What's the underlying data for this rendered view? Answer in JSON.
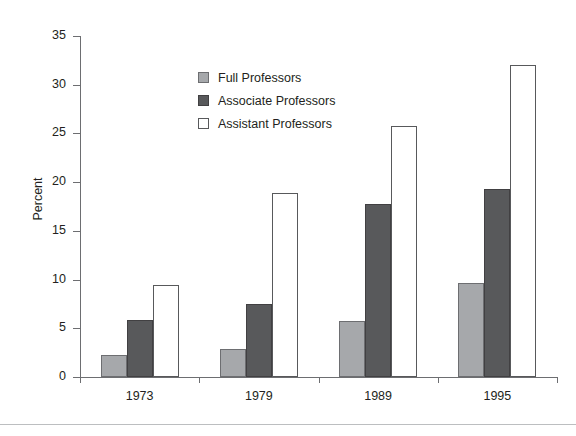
{
  "chart_data": {
    "type": "bar",
    "title": "",
    "xlabel": "",
    "ylabel": "Percent",
    "categories": [
      "1973",
      "1979",
      "1989",
      "1995"
    ],
    "ylim": [
      0,
      35
    ],
    "ytick_labels": [
      "0",
      "5",
      "10",
      "15",
      "20",
      "25",
      "30",
      "35"
    ],
    "ytick_values": [
      0,
      5,
      10,
      15,
      20,
      25,
      30,
      35
    ],
    "grid": false,
    "legend_position": "upper-left-inside",
    "series": [
      {
        "name": "Full Professors",
        "color": "#a6a8ab",
        "edge_color": "#6d6e71",
        "values": [
          2.3,
          2.9,
          5.8,
          9.6
        ]
      },
      {
        "name": "Associate Professors",
        "color": "#58595b",
        "edge_color": "#414042",
        "values": [
          5.9,
          7.5,
          17.8,
          19.3
        ]
      },
      {
        "name": "Assistant Professors",
        "color": "#ffffff",
        "edge_color": "#58595b",
        "values": [
          9.4,
          18.9,
          25.8,
          32.0
        ]
      }
    ]
  },
  "axis": {
    "y_title": "Percent"
  }
}
